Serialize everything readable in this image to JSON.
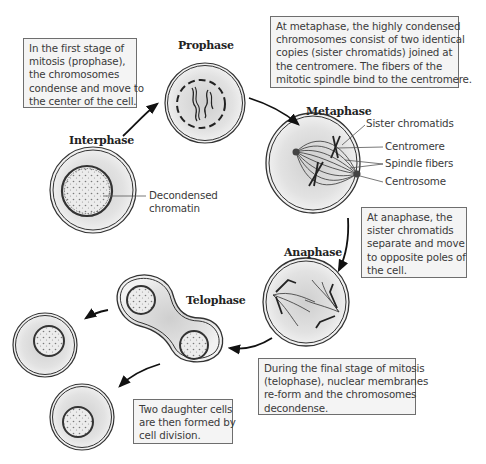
{
  "colors": {
    "box_background": "#f4f4f4",
    "box_border": "#6e6e6e",
    "cell_fill": "#e6e6e6",
    "cell_outline": "#333333",
    "text": "#3a3a3a"
  },
  "stages": {
    "interphase": "Interphase",
    "prophase": "Prophase",
    "metaphase": "Metaphase",
    "anaphase": "Anaphase",
    "telophase": "Telophase"
  },
  "callouts": {
    "interphase": [
      "Decondensed",
      "chromatin"
    ],
    "metaphase": [
      "Sister chromatids",
      "Centromere",
      "Spindle fibers",
      "Centrosome"
    ]
  },
  "boxes": {
    "prophase": [
      "In the first stage of",
      "mitosis (prophase),",
      "the chromosomes",
      "condense and move to",
      "the center of the cell."
    ],
    "metaphase": [
      "At metaphase, the highly condensed",
      "chromosomes consist of two identical",
      "copies (sister chromatids) joined at",
      "the centromere. The fibers of the",
      "mitotic spindle bind to the centromere."
    ],
    "anaphase": [
      "At anaphase, the",
      "sister chromatids",
      "separate and move",
      "to opposite poles of",
      "the cell."
    ],
    "telophase": [
      "During the final stage of mitosis",
      "(telophase), nuclear membranes",
      "re-form and the chromosomes",
      "decondense."
    ],
    "daughter": [
      "Two daughter cells",
      "are then formed by",
      "cell division."
    ]
  }
}
